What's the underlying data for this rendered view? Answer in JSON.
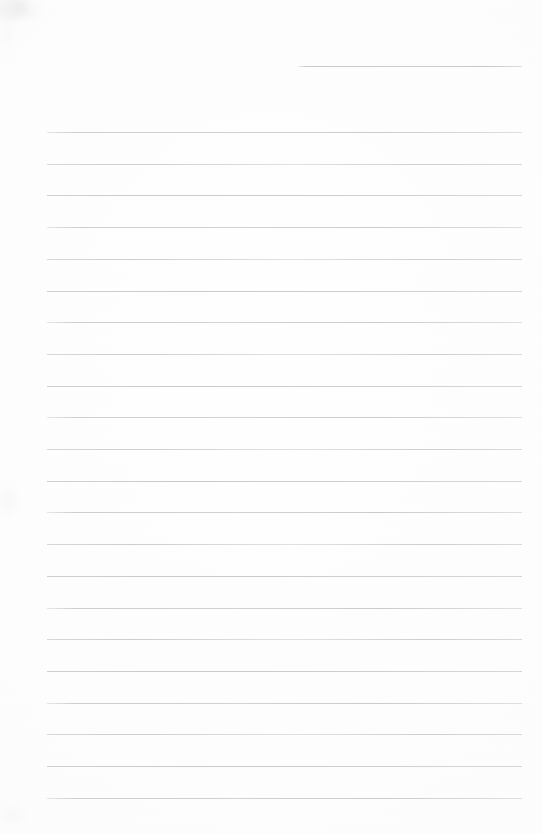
{
  "document": {
    "kind": "scanned-lined-paper",
    "title": "Blank ruled notebook page",
    "page_width": 542,
    "page_height": 834,
    "background_color": "#fdfdfd",
    "rule_color": "#c6c6ca",
    "rule_thickness": 1,
    "content_text": "",
    "has_handwriting": false,
    "has_printed_text": false
  },
  "header_rule": {
    "label": "partial header rule",
    "x_start": 298,
    "x_end": 522,
    "y": 66,
    "width": 224
  },
  "body_rules": {
    "label": "ruled writing lines",
    "count": 22,
    "x_start": 47,
    "x_end": 522,
    "width": 475,
    "first_y": 132,
    "spacing": 31.7,
    "y_positions": [
      132,
      163.7,
      195.4,
      227.1,
      258.8,
      290.5,
      322.2,
      353.9,
      385.6,
      417.3,
      449,
      480.7,
      512.4,
      544.1,
      575.8,
      607.5,
      639.2,
      670.9,
      702.6,
      734.3,
      766,
      797.7
    ]
  },
  "artifacts": {
    "label": "scan smudges",
    "regions": [
      "top-left corner",
      "left edge mid",
      "left edge bottom"
    ]
  }
}
